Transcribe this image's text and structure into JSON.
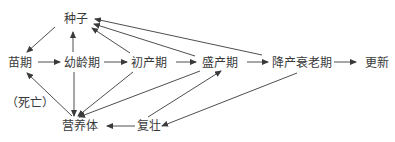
{
  "diagram": {
    "type": "flow",
    "nodes": {
      "seed": "种子",
      "seedling": "苗期",
      "juvenile": "幼龄期",
      "initial_production": "初产期",
      "peak_production": "盛产期",
      "decline_senescence": "降产衰老期",
      "renewal": "更新",
      "death": "（死亡）",
      "vegetative": "营养体",
      "rejuvenation": "复壮"
    },
    "edges": [
      {
        "from": "种子",
        "to": "苗期"
      },
      {
        "from": "苗期",
        "to": "幼龄期"
      },
      {
        "from": "幼龄期",
        "to": "初产期"
      },
      {
        "from": "初产期",
        "to": "盛产期"
      },
      {
        "from": "盛产期",
        "to": "降产衰老期"
      },
      {
        "from": "降产衰老期",
        "to": "更新"
      },
      {
        "from": "幼龄期",
        "to": "种子"
      },
      {
        "from": "初产期",
        "to": "种子"
      },
      {
        "from": "盛产期",
        "to": "种子"
      },
      {
        "from": "降产衰老期",
        "to": "种子"
      },
      {
        "from": "幼龄期",
        "to": "营养体"
      },
      {
        "from": "初产期",
        "to": "营养体"
      },
      {
        "from": "盛产期",
        "to": "营养体"
      },
      {
        "from": "营养体",
        "to": "苗期"
      },
      {
        "from": "降产衰老期",
        "to": "复壮"
      },
      {
        "from": "复壮",
        "to": "盛产期"
      },
      {
        "from": "复壮",
        "to": "营养体"
      }
    ],
    "colors": {
      "line": "#3a3a3a",
      "text": "#3a3a3a",
      "background": "#ffffff"
    }
  }
}
